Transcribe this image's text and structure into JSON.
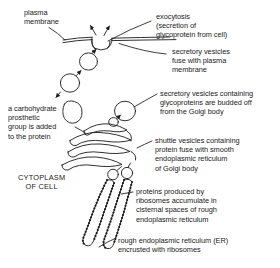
{
  "diagram": {
    "stroke_color": "#1a1a1a",
    "background": "#ffffff",
    "labels": {
      "plasma_membrane": "plasma\nmembrane",
      "exocytosis": "exocytosis\n(secretion of\nglycoprotein from cell)",
      "secretory_fuse": "secretory vesicles\nfuse with plasma\nmembrane",
      "budded_off": "secretory vesicles containing\nglycoproteins are budded off\nfrom the Golgi body",
      "carbohydrate": "a carbohydrate\nprosthetic\ngroup is added\nto the protein",
      "shuttle_vesicles": "shuttle vesicles containing\nprotein fuse with smooth\nendoplasmic reticulum\nof Golgi body",
      "cytoplasm": "CYTOPLASM\nOF CELL",
      "proteins_produced": "proteins produced by\nribosomes accumulate in\ncisternal spaces of rough\nendoplasmic reticulum",
      "rough_er": "rough endoplasmic reticulum (ER)\nencrusted with ribosomes"
    },
    "structures": [
      "plasma membrane",
      "exocytosis pore",
      "secretory vesicles",
      "Golgi body cisternae",
      "shuttle vesicles",
      "rough endoplasmic reticulum",
      "ribosomes"
    ]
  }
}
